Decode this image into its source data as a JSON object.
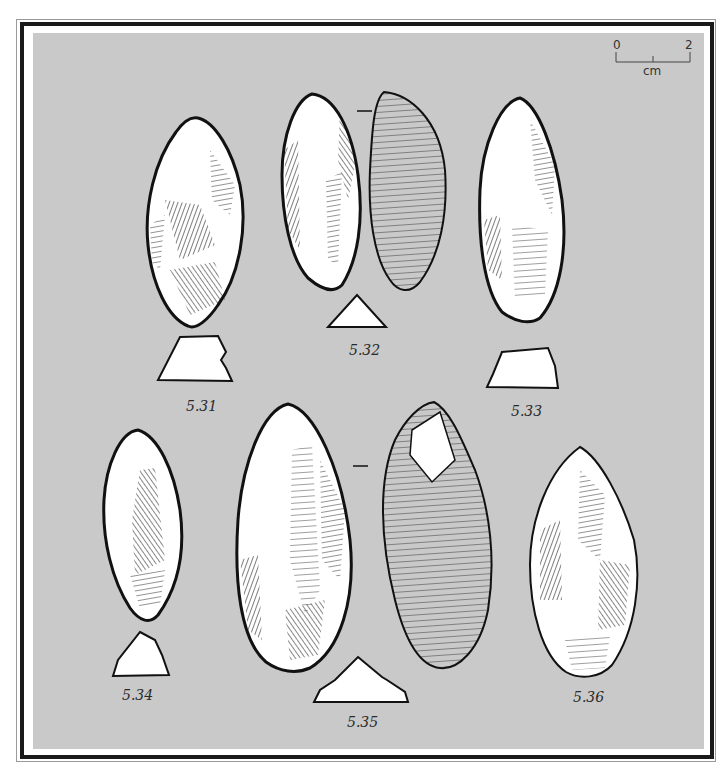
{
  "plate": {
    "background_color": "#c9c9c9",
    "ink_color": "#111111",
    "frame_color": "#1a1a1a"
  },
  "scale_bar": {
    "start_label": "0",
    "end_label": "2",
    "unit_label": "cm"
  },
  "figures": [
    {
      "id": "5.31",
      "label": "5.31",
      "views": 1,
      "has_section": true
    },
    {
      "id": "5.32",
      "label": "5.32",
      "views": 2,
      "has_section": true,
      "view_separator": "—"
    },
    {
      "id": "5.33",
      "label": "5.33",
      "views": 1,
      "has_section": true
    },
    {
      "id": "5.34",
      "label": "5.34",
      "views": 1,
      "has_section": true
    },
    {
      "id": "5.35",
      "label": "5.35",
      "views": 2,
      "has_section": true,
      "view_separator": "—"
    },
    {
      "id": "5.36",
      "label": "5.36",
      "views": 1,
      "has_section": false
    }
  ]
}
